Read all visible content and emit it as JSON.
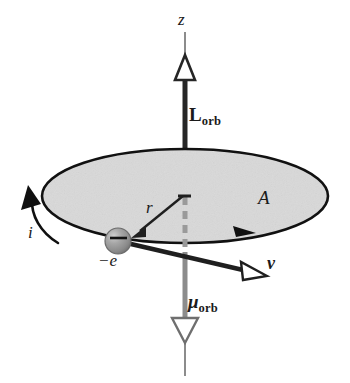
{
  "figure": {
    "background_color": "#ffffff"
  },
  "colors": {
    "disk_fill": "#d9d9d9",
    "disk_stroke": "#111111",
    "axis_dark": "#262626",
    "axis_gray": "#8c8c8c",
    "electron_fill": "#8f8f8f",
    "electron_highlight": "#c9c9c9",
    "label_color": "#1a1a1a",
    "arrow_hollow_fill": "#ffffff"
  },
  "labels": {
    "z_axis": "z",
    "angular_momentum": "L",
    "angular_momentum_sub": "orb",
    "magnetic_moment": "μ",
    "magnetic_moment_sub": "orb",
    "area": "A",
    "radius": "r",
    "current": "i",
    "velocity": "v",
    "charge": "−e"
  },
  "elements": {
    "orbit_disk": "shaded elliptical orbit plane",
    "z_axis_line": "vertical rotation axis",
    "angular_momentum_vector": "upward hollow-head vector along +z",
    "magnetic_moment_vector": "downward hollow-head gray vector along −z",
    "radius_vector": "arrow from orbit center to electron",
    "velocity_vector": "tangential hollow-head vector at electron",
    "current_arc": "curved arrow showing conventional current direction",
    "current_tip": "solid arrowhead on orbit rim",
    "electron_sphere": "shaded sphere carrying charge minus e",
    "hidden_axis_dashes": "dashed segment of axis behind the disk"
  },
  "geometry": {
    "disk_center": [
      185,
      196
    ],
    "disk_rx": 143,
    "disk_ry": 47,
    "electron_center": [
      118,
      241
    ],
    "electron_radius": 13,
    "axis_x": 185,
    "axis_top_y": 32,
    "axis_bottom_y": 376
  }
}
